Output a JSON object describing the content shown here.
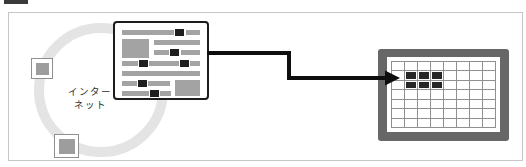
{
  "figure": {
    "internet_label": [
      "インター",
      "ネット"
    ],
    "colors": {
      "frame_border": "#c6c6c6",
      "ring": "#e4e4e4",
      "node_border": "#8f8f8f",
      "node_fill": "#9d9d9d",
      "label_text": "#2f2f2f",
      "page_border": "#1c1c1c",
      "bar_gray": "#a3a3a3",
      "bar_dark": "#1f1f1f",
      "arrow": "#0e0e0e",
      "monitor_frame": "#676767",
      "screen_bg": "#ffffff",
      "grid_line": "#8f8f8f",
      "pixel": "#262626",
      "crop_fragment": "#3a3a3a"
    },
    "webpage_bars": [
      {
        "x": 7,
        "y": 7,
        "w": 52,
        "h": 5,
        "tone": "gray"
      },
      {
        "x": 60,
        "y": 6,
        "w": 9,
        "h": 7,
        "tone": "dark"
      },
      {
        "x": 71,
        "y": 7,
        "w": 14,
        "h": 5,
        "tone": "gray"
      },
      {
        "x": 7,
        "y": 16,
        "w": 27,
        "h": 19,
        "tone": "gray"
      },
      {
        "x": 39,
        "y": 17,
        "w": 46,
        "h": 5,
        "tone": "gray"
      },
      {
        "x": 39,
        "y": 27,
        "w": 15,
        "h": 5,
        "tone": "gray"
      },
      {
        "x": 55,
        "y": 26,
        "w": 9,
        "h": 7,
        "tone": "dark"
      },
      {
        "x": 66,
        "y": 27,
        "w": 19,
        "h": 5,
        "tone": "gray"
      },
      {
        "x": 7,
        "y": 38,
        "w": 16,
        "h": 5,
        "tone": "gray"
      },
      {
        "x": 24,
        "y": 37,
        "w": 9,
        "h": 7,
        "tone": "dark"
      },
      {
        "x": 34,
        "y": 38,
        "w": 30,
        "h": 5,
        "tone": "gray"
      },
      {
        "x": 65,
        "y": 37,
        "w": 9,
        "h": 7,
        "tone": "dark"
      },
      {
        "x": 75,
        "y": 38,
        "w": 10,
        "h": 5,
        "tone": "gray"
      },
      {
        "x": 7,
        "y": 48,
        "w": 78,
        "h": 5,
        "tone": "gray"
      },
      {
        "x": 7,
        "y": 58,
        "w": 15,
        "h": 5,
        "tone": "gray"
      },
      {
        "x": 23,
        "y": 57,
        "w": 9,
        "h": 7,
        "tone": "dark"
      },
      {
        "x": 33,
        "y": 58,
        "w": 22,
        "h": 5,
        "tone": "gray"
      },
      {
        "x": 60,
        "y": 57,
        "w": 25,
        "h": 16,
        "tone": "gray"
      },
      {
        "x": 7,
        "y": 68,
        "w": 27,
        "h": 5,
        "tone": "gray"
      },
      {
        "x": 35,
        "y": 67,
        "w": 9,
        "h": 7,
        "tone": "dark"
      },
      {
        "x": 45,
        "y": 68,
        "w": 11,
        "h": 5,
        "tone": "gray"
      }
    ],
    "monitor_grid": {
      "cols": 8,
      "rows": 7,
      "filled_cells": [
        {
          "row": 1,
          "col": 1
        },
        {
          "row": 1,
          "col": 2
        },
        {
          "row": 1,
          "col": 3
        },
        {
          "row": 2,
          "col": 1
        },
        {
          "row": 2,
          "col": 2
        },
        {
          "row": 2,
          "col": 3
        }
      ]
    }
  }
}
